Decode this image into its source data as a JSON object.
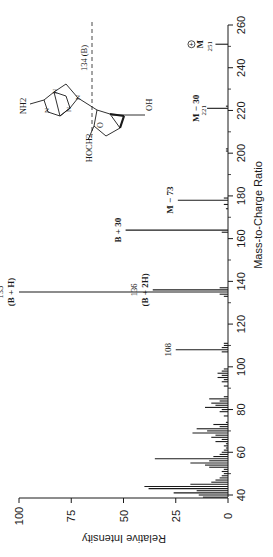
{
  "chart_data": {
    "type": "bar",
    "orientation": "rotated-90ccw",
    "title": "",
    "xlabel": "Mass-to-Charge Ratio",
    "ylabel": "Relative Intensity",
    "xlim": [
      40,
      260
    ],
    "ylim": [
      0,
      100
    ],
    "x_ticks_labeled": [
      40,
      60,
      80,
      100,
      120,
      140,
      160,
      180,
      200,
      220,
      240,
      260
    ],
    "x_ticks_minor": [
      50,
      70,
      90,
      110,
      130,
      150,
      170,
      190,
      210,
      230,
      250
    ],
    "y_ticks": [
      0,
      25,
      50,
      75,
      100
    ],
    "grid": false,
    "peaks": [
      {
        "mz": 39,
        "intensity": 12
      },
      {
        "mz": 40,
        "intensity": 14
      },
      {
        "mz": 41,
        "intensity": 26
      },
      {
        "mz": 42,
        "intensity": 15
      },
      {
        "mz": 43,
        "intensity": 38
      },
      {
        "mz": 44,
        "intensity": 40
      },
      {
        "mz": 45,
        "intensity": 18
      },
      {
        "mz": 46,
        "intensity": 8
      },
      {
        "mz": 47,
        "intensity": 6
      },
      {
        "mz": 48,
        "intensity": 4
      },
      {
        "mz": 49,
        "intensity": 3
      },
      {
        "mz": 50,
        "intensity": 2
      },
      {
        "mz": 51,
        "intensity": 3
      },
      {
        "mz": 52,
        "intensity": 2
      },
      {
        "mz": 53,
        "intensity": 9
      },
      {
        "mz": 54,
        "intensity": 11
      },
      {
        "mz": 55,
        "intensity": 18
      },
      {
        "mz": 56,
        "intensity": 9
      },
      {
        "mz": 57,
        "intensity": 35
      },
      {
        "mz": 58,
        "intensity": 7
      },
      {
        "mz": 59,
        "intensity": 4
      },
      {
        "mz": 60,
        "intensity": 3
      },
      {
        "mz": 61,
        "intensity": 2
      },
      {
        "mz": 62,
        "intensity": 1
      },
      {
        "mz": 63,
        "intensity": 2
      },
      {
        "mz": 64,
        "intensity": 1
      },
      {
        "mz": 65,
        "intensity": 6
      },
      {
        "mz": 66,
        "intensity": 3
      },
      {
        "mz": 67,
        "intensity": 8
      },
      {
        "mz": 68,
        "intensity": 6
      },
      {
        "mz": 69,
        "intensity": 17
      },
      {
        "mz": 70,
        "intensity": 10
      },
      {
        "mz": 71,
        "intensity": 15
      },
      {
        "mz": 72,
        "intensity": 4
      },
      {
        "mz": 73,
        "intensity": 7
      },
      {
        "mz": 74,
        "intensity": 1
      },
      {
        "mz": 77,
        "intensity": 2
      },
      {
        "mz": 79,
        "intensity": 4
      },
      {
        "mz": 80,
        "intensity": 3
      },
      {
        "mz": 81,
        "intensity": 11
      },
      {
        "mz": 82,
        "intensity": 6
      },
      {
        "mz": 83,
        "intensity": 8
      },
      {
        "mz": 84,
        "intensity": 4
      },
      {
        "mz": 85,
        "intensity": 9
      },
      {
        "mz": 86,
        "intensity": 2
      },
      {
        "mz": 91,
        "intensity": 2
      },
      {
        "mz": 93,
        "intensity": 3
      },
      {
        "mz": 94,
        "intensity": 2
      },
      {
        "mz": 95,
        "intensity": 5
      },
      {
        "mz": 96,
        "intensity": 3
      },
      {
        "mz": 97,
        "intensity": 5
      },
      {
        "mz": 98,
        "intensity": 3
      },
      {
        "mz": 99,
        "intensity": 2
      },
      {
        "mz": 107,
        "intensity": 3
      },
      {
        "mz": 108,
        "intensity": 25
      },
      {
        "mz": 109,
        "intensity": 3
      },
      {
        "mz": 110,
        "intensity": 2
      },
      {
        "mz": 111,
        "intensity": 2
      },
      {
        "mz": 133,
        "intensity": 2
      },
      {
        "mz": 134,
        "intensity": 4
      },
      {
        "mz": 135,
        "intensity": 100
      },
      {
        "mz": 136,
        "intensity": 36
      },
      {
        "mz": 137,
        "intensity": 4
      },
      {
        "mz": 163,
        "intensity": 3
      },
      {
        "mz": 164,
        "intensity": 49
      },
      {
        "mz": 174,
        "intensity": 1
      },
      {
        "mz": 176,
        "intensity": 2
      },
      {
        "mz": 178,
        "intensity": 24
      },
      {
        "mz": 179,
        "intensity": 2
      },
      {
        "mz": 201,
        "intensity": 1
      },
      {
        "mz": 202,
        "intensity": 1
      },
      {
        "mz": 221,
        "intensity": 10
      },
      {
        "mz": 222,
        "intensity": 1
      },
      {
        "mz": 251,
        "intensity": 6
      }
    ],
    "annotations": [
      {
        "mz": 135,
        "label": "135",
        "sublabel": "(B + H)"
      },
      {
        "mz": 136,
        "label": "136",
        "sublabel": "(B + 2H)"
      },
      {
        "mz": 108,
        "label": "108",
        "sublabel": ""
      },
      {
        "mz": 164,
        "label": "B + 30",
        "sublabel": ""
      },
      {
        "mz": 178,
        "label": "M − 73",
        "sublabel": ""
      },
      {
        "mz": 221,
        "label": "M − 30",
        "sublabel": "221"
      },
      {
        "mz": 251,
        "label": "M",
        "sublabel": "251",
        "charge": "+"
      }
    ],
    "structure": {
      "name": "cordycepin-like nucleoside",
      "labels": {
        "amine": "NH2",
        "hydroxymethyl": "HOCH2",
        "hydroxyl": "OH",
        "ring_oxygen": "O",
        "cleavage": "134 (B)"
      }
    }
  },
  "colors": {
    "ink": "#1a1a1a",
    "background": "#ffffff"
  }
}
